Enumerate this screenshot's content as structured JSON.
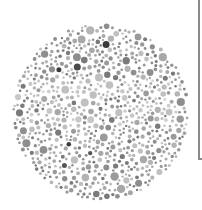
{
  "image": {
    "description": "Grayscale color-vision test plate made of dots",
    "background": "#ffffff",
    "plate": {
      "cx": 101,
      "cy": 112,
      "r": 89
    },
    "band": {
      "y_top": 80,
      "y_bottom": 125,
      "label": "horizontal hidden band of darker/lighter dots"
    },
    "palette": {
      "field": [
        "#9a9a9a",
        "#a8a8a8",
        "#b4b4b4",
        "#8e8e8e",
        "#c0c0c0",
        "#7a7a7a"
      ],
      "dark": [
        "#3a3a3a",
        "#4a4a4a",
        "#555555"
      ],
      "band": [
        "#c8c8c8",
        "#bcbcbc",
        "#d0d0d0"
      ]
    },
    "seed": 7
  }
}
